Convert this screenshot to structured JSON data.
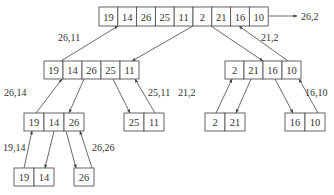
{
  "nodes": [
    {
      "id": "root",
      "x": 99,
      "y": 7,
      "w": 18.8,
      "h": 19,
      "values": [
        "19",
        "14",
        "26",
        "25",
        "11",
        "2",
        "21",
        "16",
        "10"
      ]
    },
    {
      "id": "L",
      "x": 44,
      "y": 61,
      "w": 19,
      "h": 18,
      "values": [
        "19",
        "14",
        "26",
        "25",
        "11"
      ]
    },
    {
      "id": "R",
      "x": 225,
      "y": 61,
      "w": 19,
      "h": 18,
      "values": [
        "2",
        "21",
        "16",
        "10"
      ]
    },
    {
      "id": "LL",
      "x": 24,
      "y": 113,
      "w": 20,
      "h": 18,
      "values": [
        "19",
        "14",
        "26"
      ]
    },
    {
      "id": "LR",
      "x": 124,
      "y": 113,
      "w": 20,
      "h": 18,
      "values": [
        "25",
        "11"
      ]
    },
    {
      "id": "RL",
      "x": 205,
      "y": 113,
      "w": 20,
      "h": 18,
      "values": [
        "2",
        "21"
      ]
    },
    {
      "id": "RR",
      "x": 285,
      "y": 113,
      "w": 20,
      "h": 18,
      "values": [
        "16",
        "10"
      ]
    },
    {
      "id": "LLL",
      "x": 14,
      "y": 168,
      "w": 20,
      "h": 18,
      "values": [
        "19",
        "14"
      ]
    },
    {
      "id": "LLR",
      "x": 74,
      "y": 168,
      "w": 20,
      "h": 18,
      "values": [
        "26"
      ]
    }
  ],
  "edges": [
    {
      "x1": 193,
      "y1": 26,
      "x2": 132,
      "y2": 61,
      "arrow": "end"
    },
    {
      "x1": 61,
      "y1": 61,
      "x2": 118,
      "y2": 26,
      "arrow": "end"
    },
    {
      "x1": 211,
      "y1": 26,
      "x2": 263,
      "y2": 61,
      "arrow": "end"
    },
    {
      "x1": 288,
      "y1": 61,
      "x2": 239,
      "y2": 26,
      "arrow": "end"
    },
    {
      "x1": 268,
      "y1": 16,
      "x2": 297,
      "y2": 16,
      "arrow": "end"
    },
    {
      "x1": 84,
      "y1": 79,
      "x2": 69,
      "y2": 113,
      "arrow": "end"
    },
    {
      "x1": 36,
      "y1": 113,
      "x2": 62,
      "y2": 79,
      "arrow": "end"
    },
    {
      "x1": 113,
      "y1": 79,
      "x2": 130,
      "y2": 113,
      "arrow": "end"
    },
    {
      "x1": 155,
      "y1": 113,
      "x2": 135,
      "y2": 79,
      "arrow": "end"
    },
    {
      "x1": 251,
      "y1": 79,
      "x2": 236,
      "y2": 113,
      "arrow": "end"
    },
    {
      "x1": 216,
      "y1": 113,
      "x2": 232,
      "y2": 79,
      "arrow": "end"
    },
    {
      "x1": 275,
      "y1": 79,
      "x2": 293,
      "y2": 113,
      "arrow": "end"
    },
    {
      "x1": 318,
      "y1": 113,
      "x2": 299,
      "y2": 79,
      "arrow": "end"
    },
    {
      "x1": 54,
      "y1": 131,
      "x2": 45,
      "y2": 168,
      "arrow": "end"
    },
    {
      "x1": 24,
      "y1": 168,
      "x2": 32,
      "y2": 131,
      "arrow": "end"
    },
    {
      "x1": 66,
      "y1": 131,
      "x2": 76,
      "y2": 168,
      "arrow": "end"
    },
    {
      "x1": 92,
      "y1": 168,
      "x2": 80,
      "y2": 131,
      "arrow": "end"
    }
  ],
  "labels": [
    {
      "text": "26,2",
      "x": 301,
      "y": 20
    },
    {
      "text": "26,11",
      "x": 58,
      "y": 41
    },
    {
      "text": "21,2",
      "x": 261,
      "y": 41
    },
    {
      "text": "26,14",
      "x": 4,
      "y": 96
    },
    {
      "text": "25,11",
      "x": 148,
      "y": 96
    },
    {
      "text": "21,2",
      "x": 178,
      "y": 96
    },
    {
      "text": "16,10",
      "x": 305,
      "y": 96
    },
    {
      "text": "19,14",
      "x": 3,
      "y": 151
    },
    {
      "text": "26,26",
      "x": 92,
      "y": 151
    }
  ]
}
